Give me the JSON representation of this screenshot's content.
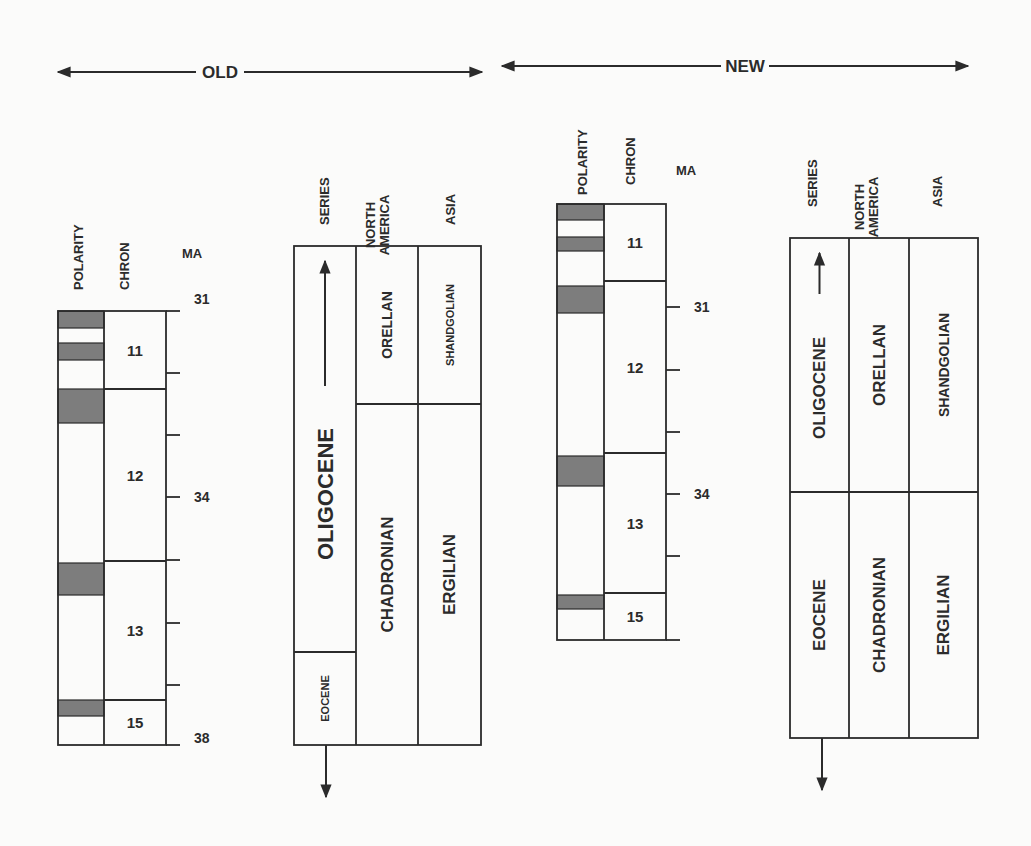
{
  "colors": {
    "ink": "#2b2b2b",
    "shade": "#7d7d7d",
    "background": "#fbfbfa"
  },
  "panels": [
    {
      "id": "old",
      "label": "OLD",
      "arrow": {
        "x1": 58,
        "x2": 482,
        "y": 72,
        "label_x": 220
      },
      "column_headers": {
        "polarity": {
          "text": "POLARITY",
          "x": 78,
          "y": 290
        },
        "chron": {
          "text": "CHRON",
          "x": 124,
          "y": 290
        },
        "ma": {
          "text": "MA",
          "x": 192,
          "y": 258
        },
        "series": {
          "text": "SERIES",
          "x": 324,
          "y": 225
        },
        "north_america": {
          "text": "NORTH AMERICA",
          "x": 377,
          "y": 225
        },
        "asia": {
          "text": "ASIA",
          "x": 450,
          "y": 225
        }
      },
      "chron_column": {
        "x_pol": 58,
        "x_split": 104,
        "x_right": 166,
        "y_top": 311,
        "y_bottom": 745,
        "chrons": [
          {
            "name": "11",
            "y_top": 311,
            "y_bottom": 389
          },
          {
            "name": "12",
            "y_top": 389,
            "y_bottom": 561
          },
          {
            "name": "13",
            "y_top": 561,
            "y_bottom": 700
          },
          {
            "name": "15",
            "y_top": 700,
            "y_bottom": 745
          }
        ],
        "normal_polarity_bands": [
          {
            "y_top": 311,
            "y_bottom": 328
          },
          {
            "y_top": 343,
            "y_bottom": 360
          },
          {
            "y_top": 389,
            "y_bottom": 423
          },
          {
            "y_top": 563,
            "y_bottom": 595
          },
          {
            "y_top": 700,
            "y_bottom": 716
          }
        ]
      },
      "ma_axis": {
        "x": 166,
        "tick_len": 14,
        "ticks": [
          {
            "y": 311,
            "label": "31"
          },
          {
            "y": 373,
            "label": ""
          },
          {
            "y": 435,
            "label": ""
          },
          {
            "y": 497,
            "label": "34"
          },
          {
            "y": 560,
            "label": ""
          },
          {
            "y": 623,
            "label": ""
          },
          {
            "y": 685,
            "label": ""
          },
          {
            "y": 745,
            "label": "38"
          }
        ]
      },
      "stratigraphy": {
        "x_left": 294,
        "x_c1": 356,
        "x_c2": 418,
        "x_right": 481,
        "y_top": 246,
        "y_bottom": 745,
        "series": [
          {
            "name": "OLIGOCENE",
            "y_top": 246,
            "y_bottom": 652,
            "font_size": 22,
            "arrow_up": true
          },
          {
            "name": "EOCENE",
            "y_top": 652,
            "y_bottom": 745,
            "font_size": 11,
            "arrow_down": true
          }
        ],
        "north_america": [
          {
            "name": "ORELLAN",
            "y_top": 246,
            "y_bottom": 404,
            "font_size": 14
          },
          {
            "name": "CHADRONIAN",
            "y_top": 404,
            "y_bottom": 745,
            "font_size": 17
          }
        ],
        "asia": [
          {
            "name": "SHANDGOLIAN",
            "y_top": 246,
            "y_bottom": 404,
            "font_size": 11
          },
          {
            "name": "ERGILIAN",
            "y_top": 404,
            "y_bottom": 745,
            "font_size": 17
          }
        ]
      }
    },
    {
      "id": "new",
      "label": "NEW",
      "arrow": {
        "x1": 502,
        "x2": 968,
        "y": 66,
        "label_x": 745
      },
      "column_headers": {
        "polarity": {
          "text": "POLARITY",
          "x": 582,
          "y": 195
        },
        "chron": {
          "text": "CHRON",
          "x": 630,
          "y": 185
        },
        "ma": {
          "text": "MA",
          "x": 686,
          "y": 175
        },
        "series": {
          "text": "SERIES",
          "x": 812,
          "y": 207
        },
        "north_america": {
          "text": "NORTH AMERICA",
          "x": 866,
          "y": 207
        },
        "asia": {
          "text": "ASIA",
          "x": 937,
          "y": 207
        }
      },
      "chron_column": {
        "x_pol": 557,
        "x_split": 604,
        "x_right": 666,
        "y_top": 204,
        "y_bottom": 640,
        "chrons": [
          {
            "name": "11",
            "y_top": 204,
            "y_bottom": 281
          },
          {
            "name": "12",
            "y_top": 281,
            "y_bottom": 453
          },
          {
            "name": "13",
            "y_top": 453,
            "y_bottom": 593
          },
          {
            "name": "15",
            "y_top": 593,
            "y_bottom": 640
          }
        ],
        "normal_polarity_bands": [
          {
            "y_top": 204,
            "y_bottom": 220
          },
          {
            "y_top": 237,
            "y_bottom": 251
          },
          {
            "y_top": 286,
            "y_bottom": 313
          },
          {
            "y_top": 456,
            "y_bottom": 486
          },
          {
            "y_top": 595,
            "y_bottom": 609
          }
        ]
      },
      "ma_axis": {
        "x": 666,
        "tick_len": 14,
        "ticks": [
          {
            "y": 307,
            "label": "31"
          },
          {
            "y": 370,
            "label": ""
          },
          {
            "y": 432,
            "label": ""
          },
          {
            "y": 494,
            "label": "34"
          },
          {
            "y": 556,
            "label": ""
          },
          {
            "y": 640,
            "label": ""
          }
        ]
      },
      "stratigraphy": {
        "x_left": 790,
        "x_c1": 849,
        "x_c2": 909,
        "x_right": 978,
        "y_top": 238,
        "y_bottom": 738,
        "series": [
          {
            "name": "OLIGOCENE",
            "y_top": 238,
            "y_bottom": 492,
            "font_size": 17,
            "arrow_up": true
          },
          {
            "name": "EOCENE",
            "y_top": 492,
            "y_bottom": 738,
            "font_size": 17,
            "arrow_down": true
          }
        ],
        "north_america": [
          {
            "name": "ORELLAN",
            "y_top": 238,
            "y_bottom": 492,
            "font_size": 17
          },
          {
            "name": "CHADRONIAN",
            "y_top": 492,
            "y_bottom": 738,
            "font_size": 17
          }
        ],
        "asia": [
          {
            "name": "SHANDGOLIAN",
            "y_top": 238,
            "y_bottom": 492,
            "font_size": 14
          },
          {
            "name": "ERGILIAN",
            "y_top": 492,
            "y_bottom": 738,
            "font_size": 17
          }
        ]
      }
    }
  ]
}
